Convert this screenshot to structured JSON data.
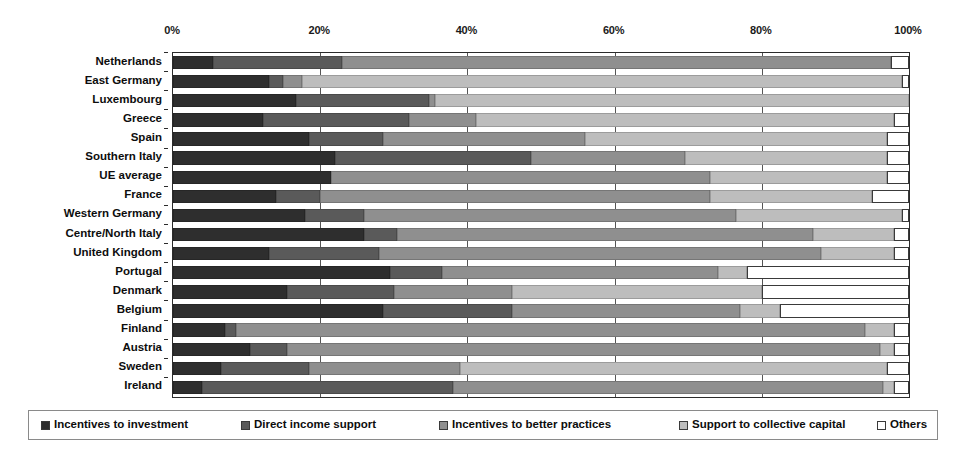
{
  "chart_data": {
    "type": "bar",
    "subtype": "stacked-horizontal-100-percent",
    "title": "",
    "xlabel": "",
    "ylabel": "",
    "xlim": [
      0,
      100
    ],
    "grid": true,
    "legend_position": "bottom",
    "xticks": [
      "0%",
      "20%",
      "40%",
      "60%",
      "80%",
      "100%"
    ],
    "xtick_values": [
      0,
      20,
      40,
      60,
      80,
      100
    ],
    "categories": [
      "Netherlands",
      "East Germany",
      "Luxembourg",
      "Greece",
      "Spain",
      "Southern Italy",
      "UE average",
      "France",
      "Western Germany",
      "Centre/North Italy",
      "United Kingdom",
      "Portugal",
      "Denmark",
      "Belgium",
      "Finland",
      "Austria",
      "Sweden",
      "Ireland"
    ],
    "series": [
      {
        "name": "Incentives to investment",
        "color": "#2e2e2e",
        "values": [
          5.5,
          13.0,
          16.7,
          12.2,
          18.5,
          22.0,
          21.5,
          14.0,
          18.0,
          26.0,
          13.0,
          29.5,
          15.5,
          28.5,
          7.0,
          10.5,
          6.5,
          4.0
        ]
      },
      {
        "name": "Direct income support",
        "color": "#5a5a5a",
        "values": [
          17.5,
          2.0,
          18.1,
          19.8,
          10.0,
          26.6,
          0.0,
          6.0,
          8.0,
          4.5,
          15.0,
          7.0,
          14.5,
          17.5,
          1.5,
          5.0,
          12.0,
          34.0
        ]
      },
      {
        "name": "Incentives to better practices",
        "color": "#8f8f8f",
        "values": [
          74.5,
          2.5,
          0.8,
          9.2,
          27.5,
          21.0,
          51.5,
          53.0,
          50.5,
          56.5,
          60.0,
          37.5,
          16.0,
          31.0,
          85.5,
          80.5,
          20.5,
          58.5
        ]
      },
      {
        "name": "Support to collective capital",
        "color": "#bdbdbd",
        "values": [
          0.0,
          81.5,
          64.4,
          56.8,
          41.0,
          27.4,
          24.0,
          22.0,
          22.5,
          11.0,
          10.0,
          4.0,
          34.0,
          5.5,
          4.0,
          2.0,
          58.0,
          1.5
        ]
      },
      {
        "name": "Others",
        "color": "#ffffff",
        "values": [
          2.5,
          1.0,
          0.0,
          2.0,
          3.0,
          3.0,
          3.0,
          5.0,
          1.0,
          2.0,
          2.0,
          22.0,
          20.0,
          17.5,
          2.0,
          2.0,
          3.0,
          2.0
        ]
      }
    ]
  },
  "legend": {
    "items": [
      {
        "label": "Incentives to investment",
        "color": "#2e2e2e"
      },
      {
        "label": "Direct income support",
        "color": "#5a5a5a"
      },
      {
        "label": "Incentives to better practices",
        "color": "#8f8f8f"
      },
      {
        "label": "Support to collective capital",
        "color": "#bdbdbd"
      },
      {
        "label": "Others",
        "color": "#ffffff"
      }
    ]
  },
  "colors": {
    "axis": "#2b2b2b",
    "gridline": "#555555",
    "background": "#ffffff",
    "text": "#0d0d0d",
    "legend_border": "#8a8a8a"
  }
}
